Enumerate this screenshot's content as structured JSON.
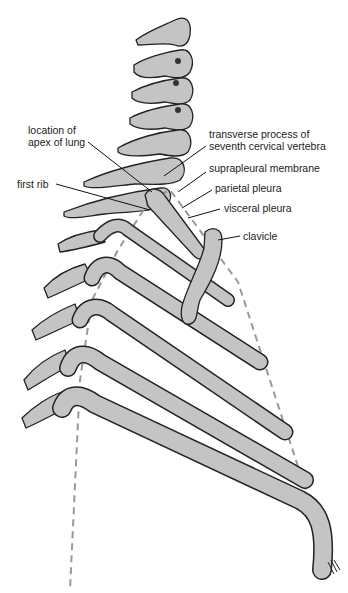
{
  "figure": {
    "colors": {
      "bone": "#c4c4c4",
      "outline": "#222222",
      "pleura_dash": "#999999",
      "background": "#ffffff"
    }
  },
  "labels": [
    {
      "id": "apex",
      "text": [
        "location of",
        "apex of lung"
      ],
      "x": 28,
      "y": 130
    },
    {
      "id": "tp7",
      "text": [
        "transverse process of",
        "seventh cervical vertebra"
      ],
      "x": 209,
      "y": 135
    },
    {
      "id": "suprapleural",
      "text": [
        "suprapleural membrane"
      ],
      "x": 209,
      "y": 167
    },
    {
      "id": "firstrib",
      "text": [
        "first rib"
      ],
      "x": 17,
      "y": 180
    },
    {
      "id": "parietal",
      "text": [
        "parietal pleura"
      ],
      "x": 215,
      "y": 185
    },
    {
      "id": "visceral",
      "text": [
        "visceral pleura"
      ],
      "x": 224,
      "y": 204
    },
    {
      "id": "clavicle",
      "text": [
        "clavicle"
      ],
      "x": 243,
      "y": 232
    }
  ]
}
